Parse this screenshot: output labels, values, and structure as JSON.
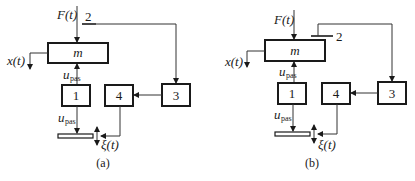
{
  "figure": {
    "panels": [
      {
        "id": "a",
        "caption": "(a)",
        "mass_label": "m",
        "force_label": "F(t)",
        "output_label": "x(t)",
        "sensor_label": "2",
        "blocks": [
          {
            "id": "1",
            "label": "1"
          },
          {
            "id": "3",
            "label": "3"
          },
          {
            "id": "4",
            "label": "4"
          }
        ],
        "control_signal": {
          "main": "u",
          "sub": "pas"
        },
        "actuator_signal": {
          "main": "u",
          "sub": "pas"
        },
        "disturbance_label": "ξ(t)"
      },
      {
        "id": "b",
        "caption": "(b)",
        "mass_label": "m",
        "force_label": "F(t)",
        "output_label": "x(t)",
        "sensor_label": "2",
        "blocks": [
          {
            "id": "1",
            "label": "1"
          },
          {
            "id": "3",
            "label": "3"
          },
          {
            "id": "4",
            "label": "4"
          }
        ],
        "control_signal": {
          "main": "u",
          "sub": "pas"
        },
        "actuator_signal": {
          "main": "u",
          "sub": "pas"
        },
        "disturbance_label": "ξ(t)"
      }
    ]
  },
  "colors": {
    "stroke": "#1a1a1a",
    "line": "#333333",
    "background": "#ffffff"
  }
}
